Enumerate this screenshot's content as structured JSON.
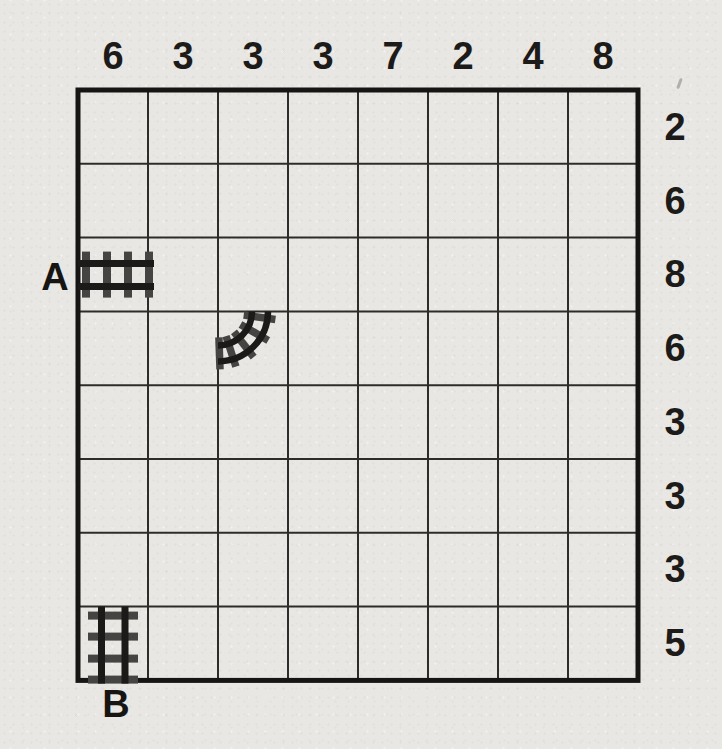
{
  "puzzle": {
    "type": "train-tracks-grid",
    "grid": {
      "rows": 8,
      "cols": 8
    }
  },
  "clues": {
    "top": [
      "6",
      "3",
      "3",
      "3",
      "7",
      "2",
      "4",
      "8"
    ],
    "right": [
      "2",
      "6",
      "8",
      "6",
      "3",
      "3",
      "3",
      "5"
    ]
  },
  "endpoints": {
    "entry_label": "A",
    "exit_label": "B"
  },
  "pieces": [
    {
      "kind": "straight-horizontal-track",
      "row": 3,
      "col": 1,
      "connects": "left-right",
      "at_label": "A"
    },
    {
      "kind": "curve-track",
      "row": 4,
      "col": 3,
      "connects": "top-left"
    },
    {
      "kind": "straight-vertical-track",
      "row": 8,
      "col": 1,
      "connects": "top-bottom",
      "at_label": "B"
    }
  ],
  "colors": {
    "paper": "#e8e7e3",
    "grid_line": "#2e2c2b",
    "grid_border": "#161514",
    "rail": "#1b1a19",
    "tie": "#454442",
    "clue_text": "#1c1b1a"
  }
}
